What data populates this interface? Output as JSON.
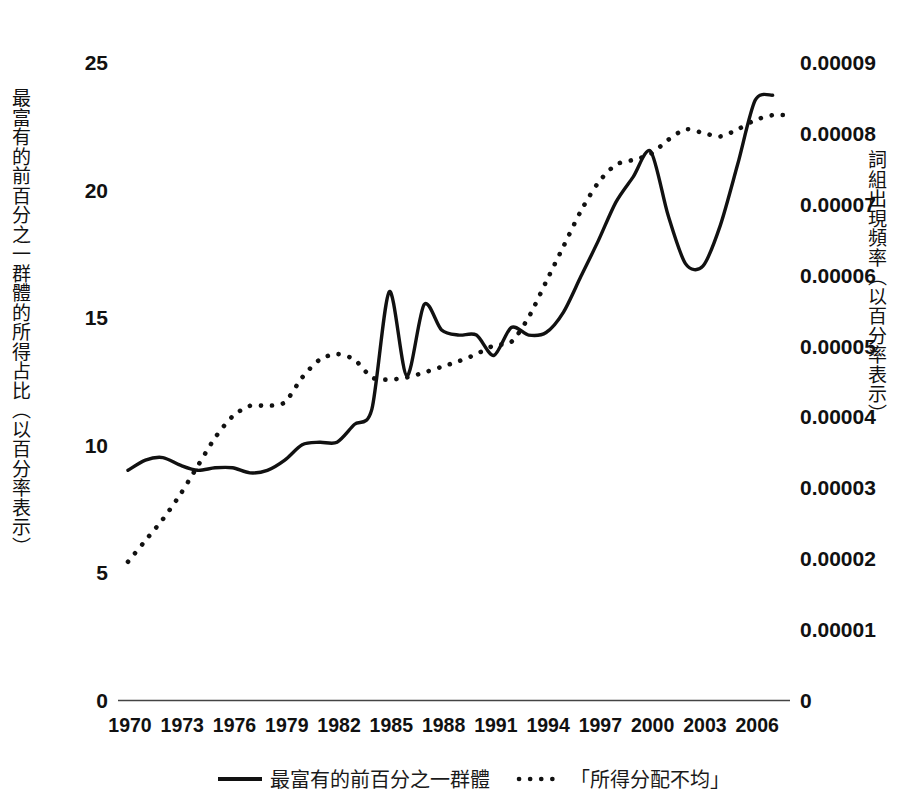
{
  "chart_data": {
    "type": "line",
    "title": "",
    "xlabel": "",
    "ylabel": "最富有的前百分之一群體的所得占比（以百分率表示）",
    "y2label": "詞組出現頻率（以百分率表示）",
    "grid": false,
    "legend_position": "bottom",
    "xlim": [
      1970,
      2008
    ],
    "ylim": [
      0,
      25
    ],
    "y2lim": [
      0,
      9e-05
    ],
    "x_ticks": [
      "1970",
      "1973",
      "1976",
      "1979",
      "1982",
      "1985",
      "1988",
      "1991",
      "1994",
      "1997",
      "2000",
      "2003",
      "2006"
    ],
    "x_tick_values": [
      1970,
      1973,
      1976,
      1979,
      1982,
      1985,
      1988,
      1991,
      1994,
      1997,
      2000,
      2003,
      2006
    ],
    "y_ticks": [
      "0",
      "5",
      "10",
      "15",
      "20",
      "25"
    ],
    "y_tick_values": [
      0,
      5,
      10,
      15,
      20,
      25
    ],
    "y2_ticks": [
      "0",
      "0.00001",
      "0.00002",
      "0.00003",
      "0.00004",
      "0.00005",
      "0.00006",
      "0.00007",
      "0.00008",
      "0.00009"
    ],
    "y2_tick_values": [
      0,
      1e-05,
      2e-05,
      3e-05,
      4e-05,
      5e-05,
      6e-05,
      7e-05,
      8e-05,
      9e-05
    ],
    "series": [
      {
        "name": "最富有的前百分之一群體",
        "style": "solid",
        "axis": "left",
        "x": [
          1970,
          1971,
          1972,
          1973,
          1974,
          1975,
          1976,
          1977,
          1978,
          1979,
          1980,
          1981,
          1982,
          1983,
          1984,
          1985,
          1986,
          1987,
          1988,
          1989,
          1990,
          1991,
          1992,
          1993,
          1994,
          1995,
          1996,
          1997,
          1998,
          1999,
          2000,
          2001,
          2002,
          2003,
          2004,
          2005,
          2006,
          2007
        ],
        "values": [
          9.0,
          9.4,
          9.5,
          9.2,
          9.0,
          9.1,
          9.1,
          8.9,
          9.0,
          9.4,
          10.0,
          10.1,
          10.1,
          10.8,
          11.4,
          16.0,
          12.7,
          15.5,
          14.5,
          14.3,
          14.3,
          13.5,
          14.6,
          14.3,
          14.4,
          15.2,
          16.6,
          18.0,
          19.5,
          20.5,
          21.5,
          19.0,
          17.1,
          17.0,
          18.6,
          21.0,
          23.5,
          23.7
        ],
        "units": "percent"
      },
      {
        "name": "「所得分配不均」",
        "style": "dotted",
        "axis": "right",
        "x": [
          1970,
          1971,
          1972,
          1973,
          1974,
          1975,
          1976,
          1977,
          1978,
          1979,
          1980,
          1981,
          1982,
          1983,
          1984,
          1985,
          1986,
          1987,
          1988,
          1989,
          1990,
          1991,
          1992,
          1993,
          1994,
          1995,
          1996,
          1997,
          1998,
          1999,
          2000,
          2001,
          2002,
          2003,
          2004,
          2005,
          2006,
          2007,
          2008
        ],
        "values": [
          1.95e-05,
          2.25e-05,
          2.55e-05,
          2.9e-05,
          3.3e-05,
          3.7e-05,
          4e-05,
          4.15e-05,
          4.15e-05,
          4.2e-05,
          4.55e-05,
          4.8e-05,
          4.88e-05,
          4.8e-05,
          4.55e-05,
          4.52e-05,
          4.55e-05,
          4.62e-05,
          4.7e-05,
          4.78e-05,
          4.88e-05,
          5e-05,
          5.05e-05,
          5.4e-05,
          5.9e-05,
          6.4e-05,
          6.9e-05,
          7.3e-05,
          7.55e-05,
          7.62e-05,
          7.7e-05,
          7.9e-05,
          8.05e-05,
          8e-05,
          7.95e-05,
          8.05e-05,
          8.18e-05,
          8.25e-05,
          8.25e-05
        ],
        "units": "frequency"
      }
    ],
    "legend": [
      {
        "label": "最富有的前百分之一群體",
        "style": "solid"
      },
      {
        "label": "「所得分配不均」",
        "style": "dotted"
      }
    ]
  },
  "axes": {
    "left_title": "最富有的前百分之一群體的所得占比（以百分率表示）",
    "right_title": "詞組出現頻率（以百分率表示）"
  },
  "legend": {
    "solid_label": "最富有的前百分之一群體",
    "dotted_label": "「所得分配不均」"
  },
  "colors": {
    "ink": "#111111",
    "axis": "#444444",
    "background": "#ffffff"
  }
}
